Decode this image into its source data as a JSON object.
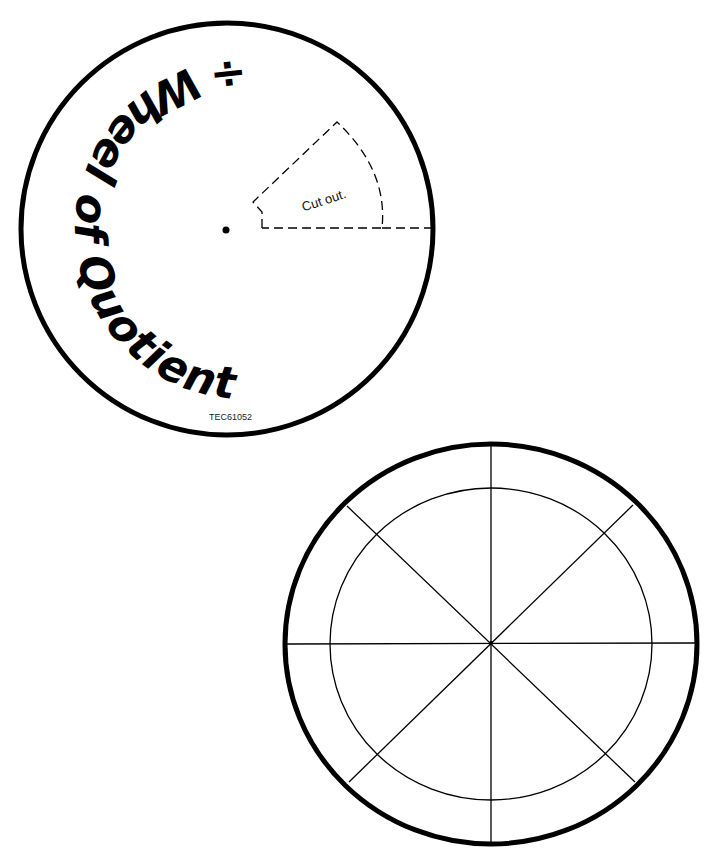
{
  "top_wheel": {
    "title": "÷ Wheel of Quotients ÷",
    "cutout_label": "Cut out.",
    "product_code": "TEC61052"
  },
  "bottom_wheel": {
    "sections": 8,
    "has_inner_ring": true
  },
  "colors": {
    "ink": "#000000",
    "paper": "#ffffff"
  }
}
